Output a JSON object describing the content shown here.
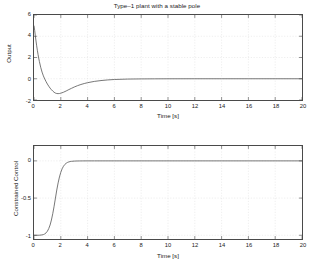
{
  "figure": {
    "width": 314,
    "height": 264,
    "background": "#ffffff",
    "line_color": "#555555",
    "axis_color": "#4a4a4a",
    "grid_color": "#dcdcdc"
  },
  "chart_data": [
    {
      "type": "line",
      "id": "output-plot",
      "title": "Type–1 plant with a stable pole",
      "xlabel": "Time [s]",
      "ylabel": "Output",
      "xlim": [
        0,
        20
      ],
      "ylim": [
        -2,
        6
      ],
      "xticks": [
        0,
        2,
        4,
        6,
        8,
        10,
        12,
        14,
        16,
        18,
        20
      ],
      "xticklabels": [
        "0",
        "2",
        "4",
        "6",
        "8",
        "10",
        "12",
        "14",
        "16",
        "18",
        "20"
      ],
      "yticks": [
        -2,
        0,
        2,
        4,
        6
      ],
      "yticklabels": [
        "-2",
        "0",
        "2",
        "4",
        "6"
      ],
      "grid": true,
      "legend": null,
      "series": [
        {
          "name": "Output",
          "color": "#555555",
          "x": [
            0,
            0.05,
            0.1,
            0.15,
            0.2,
            0.25,
            0.3,
            0.35,
            0.4,
            0.5,
            0.6,
            0.7,
            0.8,
            0.9,
            1.0,
            1.1,
            1.2,
            1.3,
            1.4,
            1.5,
            1.6,
            1.7,
            1.8,
            1.9,
            2.0,
            2.2,
            2.4,
            2.6,
            2.8,
            3.0,
            3.25,
            3.5,
            3.75,
            4.0,
            4.5,
            5.0,
            5.5,
            6.0,
            7.0,
            8.0,
            9.0,
            10.0,
            12.0,
            14.0,
            16.0,
            18.0,
            20.0
          ],
          "y": [
            5.0,
            4.55,
            4.05,
            3.55,
            3.1,
            2.68,
            2.3,
            1.95,
            1.63,
            1.08,
            0.63,
            0.27,
            -0.02,
            -0.27,
            -0.5,
            -0.7,
            -0.88,
            -1.03,
            -1.16,
            -1.27,
            -1.35,
            -1.39,
            -1.4,
            -1.39,
            -1.36,
            -1.27,
            -1.15,
            -1.02,
            -0.9,
            -0.78,
            -0.65,
            -0.54,
            -0.45,
            -0.37,
            -0.25,
            -0.17,
            -0.11,
            -0.07,
            -0.03,
            -0.015,
            -0.008,
            -0.004,
            -0.001,
            0.0,
            0.0,
            0.0,
            0.0
          ]
        }
      ]
    },
    {
      "type": "line",
      "id": "constrained-control-plot",
      "title": "",
      "xlabel": "Time [s]",
      "ylabel": "Constrained Control",
      "xlim": [
        0,
        20
      ],
      "ylim": [
        -1.05,
        0.2
      ],
      "xticks": [
        0,
        2,
        4,
        6,
        8,
        10,
        12,
        14,
        16,
        18,
        20
      ],
      "xticklabels": [
        "0",
        "2",
        "4",
        "6",
        "8",
        "10",
        "12",
        "14",
        "16",
        "18",
        "20"
      ],
      "yticks": [
        -1,
        -0.5,
        0
      ],
      "yticklabels": [
        "-1",
        "-0.5",
        "0"
      ],
      "grid": true,
      "legend": null,
      "series": [
        {
          "name": "Constrained Control",
          "color": "#555555",
          "x": [
            0,
            0.2,
            0.4,
            0.6,
            0.7,
            0.8,
            0.9,
            1.0,
            1.1,
            1.2,
            1.3,
            1.4,
            1.5,
            1.6,
            1.7,
            1.8,
            1.9,
            2.0,
            2.1,
            2.2,
            2.3,
            2.4,
            2.5,
            2.6,
            2.7,
            2.8,
            3.0,
            3.2,
            3.4,
            3.6,
            4.0,
            4.5,
            5.0,
            6.0,
            8.0,
            10.0,
            12.0,
            14.0,
            16.0,
            18.0,
            20.0
          ],
          "y": [
            -1.0,
            -1.0,
            -0.999,
            -0.995,
            -0.99,
            -0.982,
            -0.968,
            -0.945,
            -0.91,
            -0.862,
            -0.795,
            -0.71,
            -0.61,
            -0.5,
            -0.392,
            -0.296,
            -0.216,
            -0.153,
            -0.106,
            -0.072,
            -0.048,
            -0.032,
            -0.021,
            -0.014,
            -0.009,
            -0.006,
            -0.003,
            -0.0015,
            -0.0008,
            -0.0004,
            -0.0001,
            0.0,
            0.0,
            0.0,
            0.0,
            0.0,
            0.0,
            0.0,
            0.0,
            0.0,
            0.0
          ]
        }
      ]
    }
  ]
}
